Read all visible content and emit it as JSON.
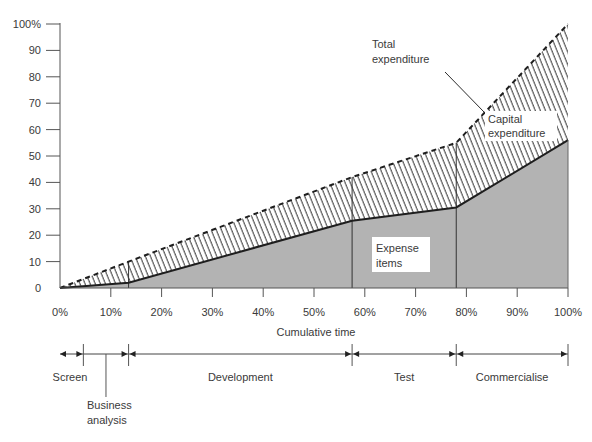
{
  "chart_data": {
    "type": "area",
    "title": "",
    "xlabel": "Cumulative time",
    "ylabel": "",
    "xlim": [
      0,
      100
    ],
    "ylim": [
      0,
      100
    ],
    "x_ticks": [
      "0%",
      "10%",
      "20%",
      "30%",
      "40%",
      "50%",
      "60%",
      "70%",
      "80%",
      "90%",
      "100%"
    ],
    "y_ticks": [
      "0",
      "10",
      "20",
      "30",
      "40",
      "50",
      "60",
      "70",
      "80",
      "90",
      "100%"
    ],
    "x": [
      0,
      13.5,
      57.5,
      78,
      100
    ],
    "series": [
      {
        "name": "Total expenditure",
        "style": "dashed-hatched",
        "values": [
          0,
          10,
          42,
          55,
          100
        ]
      },
      {
        "name": "Expense items",
        "style": "grey-fill",
        "values": [
          0,
          2,
          25.5,
          30.5,
          56
        ]
      }
    ],
    "capital_expenditure_note": "Capital expenditure = Total expenditure − Expense items (hatched region)",
    "phase_boundaries": [
      13.5,
      57.5,
      78
    ],
    "annotations": {
      "total": [
        "Total",
        "expenditure"
      ],
      "capital": [
        "Capital",
        "expenditure"
      ],
      "expense": [
        "Expense",
        "items"
      ]
    },
    "phases": [
      {
        "name": "Screen",
        "start": 0,
        "end": 4.6
      },
      {
        "name": "Business analysis",
        "lines": [
          "Business",
          "analysis"
        ],
        "start": 4.6,
        "end": 13.5
      },
      {
        "name": "Development",
        "start": 13.5,
        "end": 57.5
      },
      {
        "name": "Test",
        "start": 57.5,
        "end": 78
      },
      {
        "name": "Commercialise",
        "start": 78,
        "end": 100
      }
    ],
    "colors": {
      "expense_fill": "#b3b3b3",
      "line": "#1e1e1e",
      "axis": "#555555",
      "text": "#3a3a3a"
    }
  }
}
